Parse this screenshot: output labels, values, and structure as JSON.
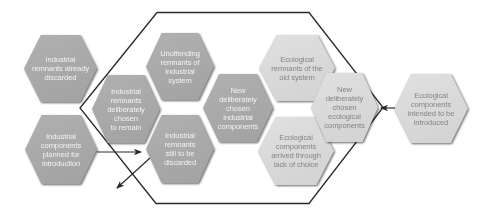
{
  "diagram": {
    "colors": {
      "dark_hex": "#a8a8a8",
      "light_hex": "#d8d8d8",
      "dark_text": "#f2f2f2",
      "light_text": "#858585",
      "outline": "#2a2a2a"
    },
    "hexagons": [
      {
        "label": "Industrial\nremnants already\ndiscarded",
        "tone": "dark"
      },
      {
        "label": "Industrial\ncomponents\nplanned for\nintroduction",
        "tone": "dark"
      },
      {
        "label": "Industrial\nremnants\ndeliberately\nchosen\nto remain",
        "tone": "dark"
      },
      {
        "label": "Unoffending\nremnants of\nindustrial\nsystem",
        "tone": "dark"
      },
      {
        "label": "Industrial\nremnants\nstill to be\ndiscarded",
        "tone": "dark"
      },
      {
        "label": "New\ndeliberately\nchosen\nindustrial\ncomponents",
        "tone": "dark"
      },
      {
        "label": "Ecological\nremnants of the\nold system",
        "tone": "light"
      },
      {
        "label": "Ecological\ncomponents\narrived through\nlack of choice",
        "tone": "light"
      },
      {
        "label": "New\ndeliberately\nchosen\necological\ncomponents",
        "tone": "light"
      },
      {
        "label": "Ecological\ncomponents\nintended to be\nintroduced",
        "tone": "light"
      }
    ],
    "arrows": [
      {
        "from": "Industrial components planned for introduction",
        "direction": "into system"
      },
      {
        "from": "Industrial remnants still to be discarded",
        "direction": "out of system"
      },
      {
        "from": "Ecological components intended to be introduced",
        "direction": "into system"
      }
    ]
  }
}
